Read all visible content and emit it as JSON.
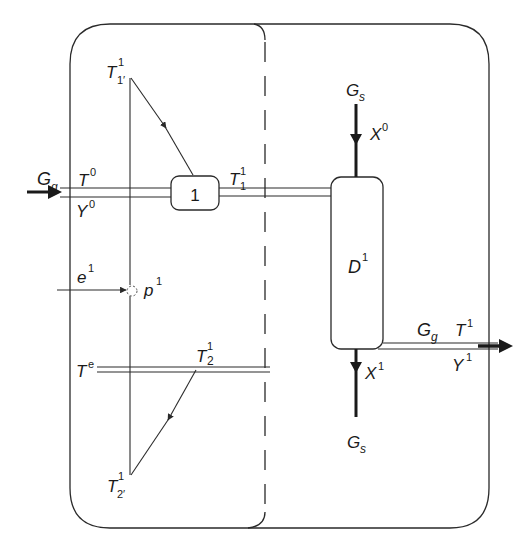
{
  "diagram": {
    "type": "process-flow-schematic",
    "colors": {
      "line": "#2a2a2a",
      "background": "#ffffff",
      "text": "#1a1a1a"
    },
    "regions": [
      {
        "id": "left-region",
        "description": "heat exchange / temperature diagram region (solid left boundary)"
      },
      {
        "id": "right-region",
        "description": "dryer/contactor region, separated by dashed divider"
      }
    ],
    "units": [
      {
        "id": "unit-1",
        "label": "1"
      },
      {
        "id": "column-D1",
        "label": "D",
        "sup": "1"
      }
    ],
    "labels": {
      "gas_in": {
        "main": "G",
        "sub": "g"
      },
      "T0": {
        "main": "T",
        "sup": "0"
      },
      "Y0": {
        "main": "Y",
        "sup": "0"
      },
      "T1p_top": {
        "main": "T",
        "sup": "1",
        "sub": "1′"
      },
      "T1_1": {
        "main": "T",
        "sup": "1",
        "sub": "1"
      },
      "e1": {
        "main": "e",
        "sup": "1"
      },
      "p1": {
        "main": "p",
        "sup": "1"
      },
      "Te": {
        "main": "T",
        "sup": "e"
      },
      "T2_1": {
        "main": "T",
        "sup": "1",
        "sub": "2"
      },
      "T2p_bottom": {
        "main": "T",
        "sup": "1",
        "sub": "2′"
      },
      "solid_in": {
        "main": "G",
        "sub": "s"
      },
      "X0": {
        "main": "X",
        "sup": "0"
      },
      "X1": {
        "main": "X",
        "sup": "1"
      },
      "solid_out": {
        "main": "G",
        "sub": "s"
      },
      "gas_out": {
        "main": "G",
        "sub": "g"
      },
      "T1_out": {
        "main": "T",
        "sup": "1"
      },
      "Y1_out": {
        "main": "Y",
        "sup": "1"
      }
    },
    "streams": [
      {
        "id": "gas-inlet",
        "from": "left-edge",
        "to": "unit-1",
        "labels": [
          "G_g",
          "T^0",
          "Y^0"
        ]
      },
      {
        "id": "gas-to-column",
        "from": "unit-1",
        "to": "column-D1",
        "labels": [
          "T^1_1"
        ]
      },
      {
        "id": "solid-inlet",
        "from": "top",
        "to": "column-D1",
        "labels": [
          "G_s",
          "X^0"
        ]
      },
      {
        "id": "solid-outlet",
        "from": "column-D1",
        "to": "bottom",
        "labels": [
          "X^1",
          "G_s"
        ]
      },
      {
        "id": "gas-outlet",
        "from": "column-D1",
        "to": "right-edge",
        "labels": [
          "G_g",
          "T^1",
          "Y^1"
        ]
      },
      {
        "id": "energy-input",
        "from": "left",
        "to": "p1",
        "labels": [
          "e^1"
        ]
      },
      {
        "id": "ambient-line",
        "labels": [
          "T^e"
        ]
      }
    ]
  }
}
